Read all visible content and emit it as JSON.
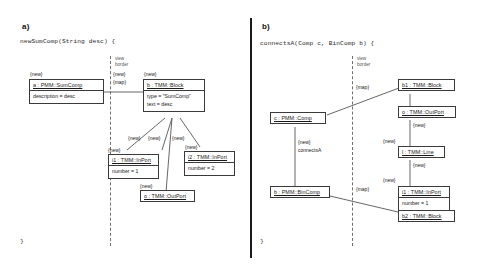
{
  "figure": {
    "panels": [
      {
        "id": "a",
        "label": "a)",
        "signature": "newSumComp(String desc) {",
        "close": "}",
        "view_border_label_line1": "view",
        "view_border_label_line2": "border",
        "annotations": {
          "new_left": "{new}",
          "new_border": "{new}",
          "map_border": "{map}",
          "new_block": "{new}",
          "new_i1": "{new}",
          "new_i2": "{new}",
          "new_o": "{new}",
          "new_fan_1": "{new}",
          "new_fan_2": "{new}",
          "new_fan_3": "{new}"
        },
        "boxes": [
          {
            "name": "sumcomp",
            "title": "a : PMM::SumComp",
            "attrs": [
              "description = desc"
            ]
          },
          {
            "name": "block",
            "title": "b : TMM::Block",
            "attrs": [
              "type = \"SumComp\"",
              "text = desc"
            ]
          },
          {
            "name": "inport1",
            "title": "i1 : TMM::InPort",
            "attrs": [
              "number = 1"
            ]
          },
          {
            "name": "inport2",
            "title": "i2 : TMM::InPort",
            "attrs": [
              "number = 2"
            ]
          },
          {
            "name": "outport",
            "title": "o : TMM::OutPort",
            "attrs": []
          }
        ]
      },
      {
        "id": "b",
        "label": "b)",
        "signature": "connectsA(Comp c, BinComp b) {",
        "close": "}",
        "view_border_label_line1": "view",
        "view_border_label_line2": "border",
        "annotations": {
          "map_top": "{map}",
          "map_bottom": "{map}",
          "new_connectsa": "{new}",
          "connectsa_label": "connectsA",
          "new_outport": "{new}",
          "new_line_upper": "{new}",
          "new_line_lower": "{new}",
          "new_inport": "{new}"
        },
        "boxes": [
          {
            "name": "comp",
            "title": "c : PMM::Comp",
            "attrs": []
          },
          {
            "name": "bincomp",
            "title": "b : PMM::BinComp",
            "attrs": []
          },
          {
            "name": "block1",
            "title": "b1 : TMM::Block",
            "attrs": []
          },
          {
            "name": "outport",
            "title": "o : TMM::OutPort",
            "attrs": []
          },
          {
            "name": "line",
            "title": "l : TMM::Line",
            "attrs": []
          },
          {
            "name": "inport",
            "title": "i1 : TMM::InPort",
            "attrs": [
              "number = 1"
            ]
          },
          {
            "name": "block2",
            "title": "b2 : TMM::Block",
            "attrs": []
          }
        ]
      }
    ],
    "colors": {
      "line": "#555555",
      "box_border": "#3a3a3a",
      "text": "#1a1a1a",
      "background": "#ffffff"
    }
  }
}
